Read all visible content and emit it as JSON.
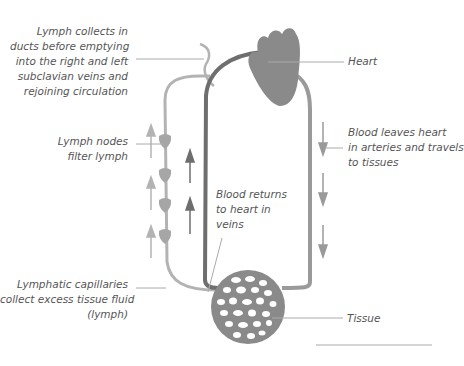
{
  "diagram": {
    "colors": {
      "lymph": "#b3b3b3",
      "vein": "#6e6e6e",
      "artery": "#9a9a9a",
      "heart": "#8a8a8a",
      "leader": "#aaaaaa",
      "text": "#555555"
    },
    "labels": {
      "lymph_ducts": [
        "Lymph collects in",
        "ducts before emptying",
        "into the right and left",
        "subclavian veins and",
        "rejoining circulation"
      ],
      "heart": "Heart",
      "lymph_nodes": [
        "Lymph nodes",
        "filter lymph"
      ],
      "blood_leaves": [
        "Blood leaves heart",
        "in arteries and travels",
        "to tissues"
      ],
      "blood_returns": [
        "Blood returns",
        "to heart in",
        "veins"
      ],
      "lymphatic_capillaries": [
        "Lymphatic capillaries",
        "collect excess tissue fluid",
        "(lymph)"
      ],
      "tissue": "Tissue"
    }
  }
}
